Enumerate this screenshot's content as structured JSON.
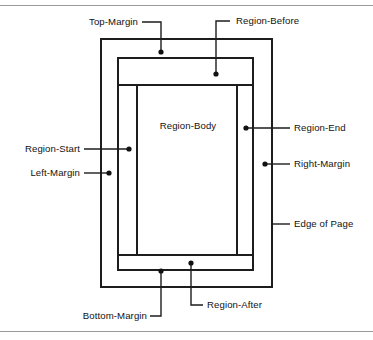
{
  "figure": {
    "colors": {
      "background": "#ffffff",
      "line": "#1d1d1d",
      "rule": "#9a9a9a",
      "text": "#121212"
    }
  },
  "labels": {
    "top_margin": "Top-Margin",
    "region_before": "Region-Before",
    "region_start": "Region-Start",
    "left_margin": "Left-Margin",
    "region_body": "Region-Body",
    "region_end": "Region-End",
    "right_margin": "Right-Margin",
    "edge_of_page": "Edge of Page",
    "bottom_margin": "Bottom-Margin",
    "region_after": "Region-After"
  },
  "regions": [
    {
      "name": "page",
      "role": "Edge of Page",
      "x": 101,
      "y": 39,
      "width": 171,
      "height": 248
    },
    {
      "name": "margin-box",
      "role": "Region-Before / Start / Body / End / After container",
      "x": 118,
      "y": 58,
      "width": 135,
      "height": 212
    },
    {
      "name": "region-before",
      "role": "Region-Before band",
      "x": 118,
      "y": 58,
      "width": 135,
      "height": 27
    },
    {
      "name": "region-start",
      "role": "Region-Start column",
      "x": 118,
      "y": 85,
      "width": 19,
      "height": 170
    },
    {
      "name": "region-body",
      "role": "Region-Body",
      "x": 137,
      "y": 85,
      "width": 100,
      "height": 170
    },
    {
      "name": "region-end",
      "role": "Region-End column",
      "x": 237,
      "y": 85,
      "width": 16,
      "height": 170
    },
    {
      "name": "region-after",
      "role": "Region-After band",
      "x": 118,
      "y": 255,
      "width": 135,
      "height": 15
    }
  ],
  "callouts": [
    {
      "target": "top-margin",
      "label": "Top-Margin",
      "dot": [
        161,
        52
      ],
      "label_anchor": [
        136,
        26
      ]
    },
    {
      "target": "region-before",
      "label": "Region-Before",
      "dot": [
        216,
        74
      ],
      "label_anchor": [
        236,
        24
      ]
    },
    {
      "target": "region-start",
      "label": "Region-Start",
      "dot": [
        129,
        149
      ],
      "label_anchor": [
        78,
        152
      ]
    },
    {
      "target": "left-margin",
      "label": "Left-Margin",
      "dot": [
        109,
        173
      ],
      "label_anchor": [
        78,
        176
      ]
    },
    {
      "target": "region-body",
      "label": "Region-Body",
      "dot": null,
      "label_anchor": [
        188,
        128
      ]
    },
    {
      "target": "region-end",
      "label": "Region-End",
      "dot": [
        246,
        128
      ],
      "label_anchor": [
        296,
        131
      ]
    },
    {
      "target": "right-margin",
      "label": "Right-Margin",
      "dot": [
        265,
        164
      ],
      "label_anchor": [
        296,
        167
      ]
    },
    {
      "target": "edge-of-page",
      "label": "Edge of Page",
      "dot": null,
      "label_anchor": [
        296,
        227
      ]
    },
    {
      "target": "bottom-margin",
      "label": "Bottom-Margin",
      "dot": [
        161,
        271
      ],
      "label_anchor": [
        156,
        320
      ]
    },
    {
      "target": "region-after",
      "label": "Region-After",
      "dot": [
        191,
        263
      ],
      "label_anchor": [
        208,
        308
      ]
    }
  ]
}
